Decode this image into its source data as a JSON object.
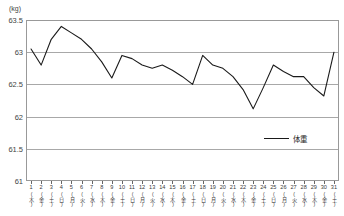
{
  "chart_data": {
    "type": "line",
    "title": "",
    "xlabel": "",
    "ylabel": "(kg)",
    "unit_label": "(kg)",
    "ylim": [
      61,
      63.5
    ],
    "yticks": [
      63.5,
      63,
      62.5,
      62,
      61.5,
      61
    ],
    "ytick_labels": [
      "63.5",
      "63",
      "62.5",
      "62",
      "61.5",
      "61"
    ],
    "grid": true,
    "legend_position": "right-inside",
    "categories": [
      "1",
      "2",
      "3",
      "4",
      "5",
      "6",
      "7",
      "8",
      "9",
      "10",
      "11",
      "12",
      "13",
      "14",
      "15",
      "16",
      "17",
      "18",
      "19",
      "20",
      "21",
      "22",
      "23",
      "24",
      "25",
      "26",
      "27",
      "28",
      "29",
      "30",
      "31"
    ],
    "weekdays": [
      "(木)",
      "(金)",
      "(土)",
      "(日)",
      "(月)",
      "(火)",
      "(水)",
      "(木)",
      "(金)",
      "(土)",
      "(日)",
      "(月)",
      "(火)",
      "(水)",
      "(木)",
      "(金)",
      "(土)",
      "(日)",
      "(月)",
      "(火)",
      "(水)",
      "(木)",
      "(金)",
      "(土)",
      "(日)",
      "(月)",
      "(火)",
      "(水)",
      "(木)",
      "(金)",
      "(土)"
    ],
    "series": [
      {
        "name": "体重",
        "color": "#1a1a1a",
        "values": [
          63.05,
          62.8,
          63.2,
          63.4,
          63.3,
          63.2,
          63.05,
          62.85,
          62.6,
          62.95,
          62.9,
          62.8,
          62.75,
          62.8,
          62.72,
          62.62,
          62.5,
          62.95,
          62.8,
          62.75,
          62.62,
          62.42,
          62.12,
          62.45,
          62.8,
          62.7,
          62.62,
          62.62,
          62.45,
          62.32,
          63.0
        ]
      }
    ]
  },
  "legend": {
    "entries": [
      {
        "label": "体重",
        "color": "#1a1a1a"
      }
    ]
  }
}
